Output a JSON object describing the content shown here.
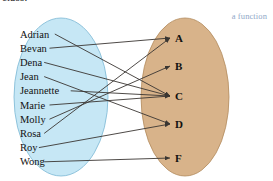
{
  "caption": {
    "clipped_text": "class."
  },
  "annotation": {
    "text": "a function",
    "color": "#8fa8c8"
  },
  "diagram": {
    "type": "function-mapping-diagram",
    "domain": {
      "name": "students",
      "fill_color": "#c6e7f5",
      "stroke_color": "#7bb8d4",
      "items": [
        {
          "id": "adrian",
          "label": "Adrian"
        },
        {
          "id": "bevan",
          "label": "Bevan"
        },
        {
          "id": "dena",
          "label": "Dena"
        },
        {
          "id": "jean",
          "label": "Jean"
        },
        {
          "id": "jeannette",
          "label": "Jeannette"
        },
        {
          "id": "marie",
          "label": "Marie"
        },
        {
          "id": "molly",
          "label": "Molly"
        },
        {
          "id": "rosa",
          "label": "Rosa"
        },
        {
          "id": "roy",
          "label": "Roy"
        },
        {
          "id": "wong",
          "label": "Wong"
        }
      ]
    },
    "codomain": {
      "name": "grades",
      "fill_color": "#d8b38a",
      "stroke_color": "#b28b5e",
      "items": [
        {
          "id": "A",
          "label": "A"
        },
        {
          "id": "B",
          "label": "B"
        },
        {
          "id": "C",
          "label": "C"
        },
        {
          "id": "D",
          "label": "D"
        },
        {
          "id": "F",
          "label": "F"
        }
      ]
    },
    "mappings": [
      {
        "from": "adrian",
        "to": "C"
      },
      {
        "from": "bevan",
        "to": "A"
      },
      {
        "from": "dena",
        "to": "C"
      },
      {
        "from": "jean",
        "to": "D"
      },
      {
        "from": "jeannette",
        "to": "C"
      },
      {
        "from": "marie",
        "to": "C"
      },
      {
        "from": "molly",
        "to": "B"
      },
      {
        "from": "rosa",
        "to": "A"
      },
      {
        "from": "roy",
        "to": "D"
      },
      {
        "from": "wong",
        "to": "F"
      }
    ],
    "arrow_color": "#3a3632"
  }
}
